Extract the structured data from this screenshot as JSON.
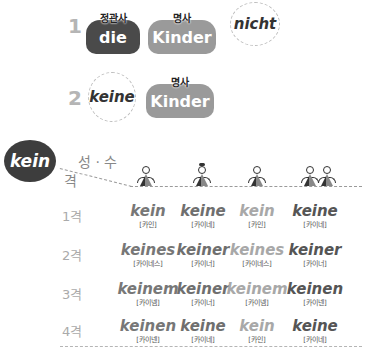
{
  "examples": [
    {
      "number": "1",
      "article": {
        "label": "정관사",
        "word": "die"
      },
      "noun": {
        "label": "명사",
        "word": "Kinder"
      },
      "replacement": "nicht"
    },
    {
      "number": "2",
      "replacement": "keine",
      "noun": {
        "label": "명사",
        "word": "Kinder"
      }
    }
  ],
  "table": {
    "badge": "kein",
    "header_gender_number": "성 · 수",
    "header_case": "격",
    "columns": [
      {
        "key": "masculine",
        "icon": "male-figure-icon"
      },
      {
        "key": "feminine",
        "icon": "female-figure-icon"
      },
      {
        "key": "neuter",
        "icon": "neuter-figure-icon"
      },
      {
        "key": "plural",
        "icon": "plural-figures-icon"
      }
    ],
    "rows": [
      {
        "case": "1격",
        "cells": [
          {
            "word": "kein",
            "pron": "[카인]"
          },
          {
            "word": "keine",
            "pron": "[카이네]"
          },
          {
            "word": "kein",
            "pron": "[카인]"
          },
          {
            "word": "keine",
            "pron": "[카이네]"
          }
        ]
      },
      {
        "case": "2격",
        "cells": [
          {
            "word": "keines",
            "pron": "[카이네스]"
          },
          {
            "word": "keiner",
            "pron": "[카이너]"
          },
          {
            "word": "keines",
            "pron": "[카이네스]"
          },
          {
            "word": "keiner",
            "pron": "[카이너]"
          }
        ]
      },
      {
        "case": "3격",
        "cells": [
          {
            "word": "keinem",
            "pron": "[카이넴]"
          },
          {
            "word": "keiner",
            "pron": "[카이너]"
          },
          {
            "word": "keinem",
            "pron": "[카이넴]"
          },
          {
            "word": "keinen",
            "pron": "[카이넨]"
          }
        ]
      },
      {
        "case": "4격",
        "cells": [
          {
            "word": "keinen",
            "pron": "[카이넨]"
          },
          {
            "word": "keine",
            "pron": "[카이네]"
          },
          {
            "word": "kein",
            "pron": "[카인]"
          },
          {
            "word": "keine",
            "pron": "[카이네]"
          }
        ]
      }
    ]
  },
  "colors": {
    "dark_blob": "#4a4a4a",
    "gray_blob": "#9a9a9a",
    "badge": "#3d3d3d"
  }
}
